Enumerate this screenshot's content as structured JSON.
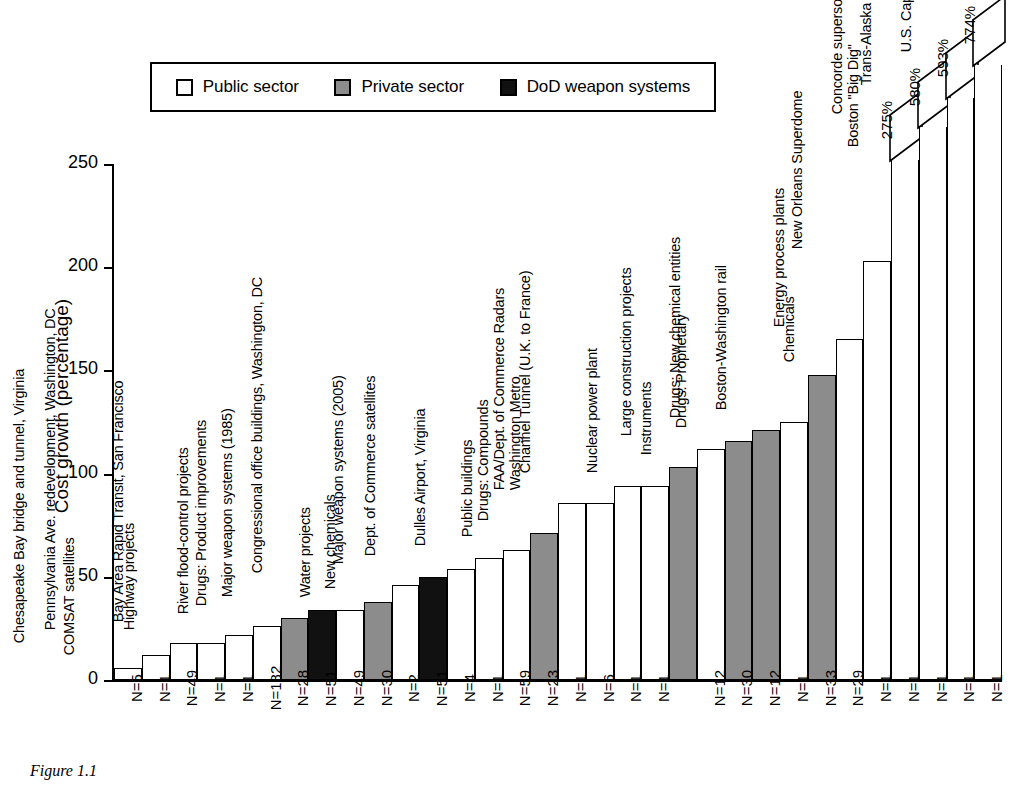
{
  "figure": {
    "caption": "Figure 1.1"
  },
  "legend": {
    "items": [
      {
        "label": "Public sector",
        "key": "public",
        "color": "#ffffff"
      },
      {
        "label": "Private sector",
        "key": "private",
        "color": "#8c8c8c"
      },
      {
        "label": "DoD weapon systems",
        "key": "dod",
        "color": "#111111"
      }
    ]
  },
  "chart_data": {
    "type": "bar",
    "title": "",
    "xlabel": "",
    "ylabel": "Cost growth (percentage)",
    "ylim": [
      0,
      250
    ],
    "yticks": [
      0,
      50,
      100,
      150,
      200,
      250
    ],
    "grid": false,
    "legend_position": "top",
    "note": "Four right-most bars are truncated; their true values are shown in break flags above the axis maximum.",
    "categories": [
      "COMSAT satellites",
      "Chesapeake Bay bridge and tunnel, Virginia",
      "Highway projects",
      "Pennsylvania Ave. redevelopment, Washington, DC",
      "Bay Area Rapid Transit, San Francisco",
      "River flood-control projects",
      "Drugs: Product improvements",
      "Major weapon systems (1985)",
      "Water projects",
      "New chemicals",
      "Congressional office buildings, Washington, DC",
      "Major weapon systems (2005)",
      "Dept. of Commerce satellites",
      "Dulles Airport, Virginia",
      "Public buildings",
      "Drugs: Compounds",
      "Washington Metro",
      "FAA/Dept. of Commerce Radars",
      "Channel Tunnel (U.K. to France)",
      "Nuclear power plant",
      "Instruments",
      "Large construction projects",
      "Drugs: Proprietary",
      "Drugs: New chemical entities",
      "Boston-Washington rail",
      "Chemicals",
      "Energy process plants",
      "New Orleans Superdome",
      "Boston \"Big Dig\"",
      "Concorde supersonic transport",
      "Trans-Alaska Pipeline System",
      "U.S. Capitol Visitor Center"
    ],
    "values": [
      6,
      12,
      18,
      18,
      22,
      26,
      30,
      34,
      34,
      38,
      46,
      50,
      54,
      59,
      63,
      71,
      86,
      86,
      94,
      94,
      103,
      112,
      116,
      121,
      125,
      148,
      165,
      203,
      275,
      580,
      593,
      774
    ],
    "sectors": [
      "public",
      "public",
      "public",
      "public",
      "public",
      "public",
      "private",
      "dod",
      "public",
      "private",
      "public",
      "dod",
      "public",
      "public",
      "public",
      "private",
      "public",
      "public",
      "public",
      "public",
      "private",
      "public",
      "private",
      "private",
      "public",
      "private",
      "public",
      "public",
      "public",
      "public",
      "public",
      "public"
    ],
    "n_labels": [
      "N=5",
      "N=1",
      "N=49",
      "N=1",
      "N=1",
      "N=182",
      "N=28",
      "N=51",
      "N=49",
      "N=30",
      "N=2",
      "N=51",
      "N=4",
      "N=1",
      "N=59",
      "N=23",
      "N=1",
      "N=6",
      "N=1",
      "N=1",
      "",
      "N=12",
      "N=30",
      "N=12",
      "N=1",
      "N=33",
      "N=29",
      "N=1",
      "N=1",
      "N=1",
      "N=1",
      "N=1"
    ],
    "truncated": [
      false,
      false,
      false,
      false,
      false,
      false,
      false,
      false,
      false,
      false,
      false,
      false,
      false,
      false,
      false,
      false,
      false,
      false,
      false,
      false,
      false,
      false,
      false,
      false,
      false,
      false,
      false,
      false,
      true,
      true,
      true,
      true
    ],
    "flag_labels": [
      "",
      "",
      "",
      "",
      "",
      "",
      "",
      "",
      "",
      "",
      "",
      "",
      "",
      "",
      "",
      "",
      "",
      "",
      "",
      "",
      "",
      "",
      "",
      "",
      "",
      "",
      "",
      "",
      "275%",
      "580%",
      "593%",
      "774%"
    ],
    "display_heights": [
      6,
      12,
      18,
      18,
      22,
      26,
      30,
      34,
      34,
      38,
      46,
      50,
      54,
      59,
      63,
      71,
      86,
      86,
      94,
      94,
      103,
      112,
      116,
      121,
      125,
      148,
      165,
      203,
      252,
      268,
      282,
      298
    ]
  }
}
